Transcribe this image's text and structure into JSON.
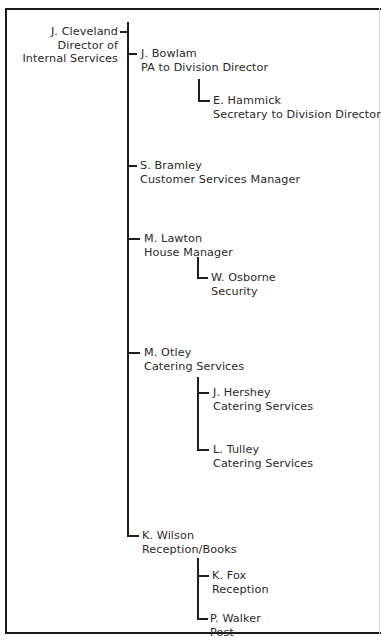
{
  "chart_title": "",
  "org_chart": {
    "root": {
      "name": "J. Cleveland",
      "role_lines": [
        "Director of",
        "Internal Services"
      ]
    },
    "reports": [
      {
        "name": "J. Bowlam",
        "role": "PA to Division Director",
        "reports": [
          {
            "name": "E. Hammick",
            "role": "Secretary to Division Director"
          }
        ]
      },
      {
        "name": "S. Bramley",
        "role": "Customer Services Manager",
        "reports": []
      },
      {
        "name": "M. Lawton",
        "role": "House Manager",
        "reports": [
          {
            "name": "W. Osborne",
            "role": "Security"
          }
        ]
      },
      {
        "name": "M. Otley",
        "role": "Catering Services",
        "reports": [
          {
            "name": "J. Hershey",
            "role": "Catering Services"
          },
          {
            "name": "L. Tulley",
            "role": "Catering Services"
          }
        ]
      },
      {
        "name": "K. Wilson",
        "role": "Reception/Books",
        "reports": [
          {
            "name": "K. Fox",
            "role": "Reception"
          },
          {
            "name": "P. Walker",
            "role": "Post"
          }
        ]
      }
    ]
  },
  "colors": {
    "line": "#1e1e1e",
    "text": "#2a2a2a",
    "background": "#ffffff"
  }
}
